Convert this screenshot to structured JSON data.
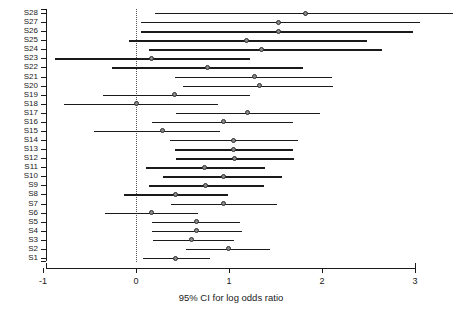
{
  "chart_data": {
    "type": "errorbar",
    "title": "",
    "xlabel": "95% CI for log odds ratio",
    "ylabel": "",
    "xlim": [
      -1,
      3
    ],
    "xticks": [
      -1,
      0,
      1,
      2,
      3
    ],
    "xticklabels": [
      "-1",
      "0",
      "1",
      "2",
      "3"
    ],
    "grid": false,
    "legend": null,
    "reference_line": {
      "x": 0,
      "style": "dotted"
    },
    "categories": [
      "S28",
      "S27",
      "S26",
      "S25",
      "S24",
      "S23",
      "S22",
      "S21",
      "S20",
      "S19",
      "S18",
      "S17",
      "S16",
      "S15",
      "S14",
      "S13",
      "S12",
      "S11",
      "S10",
      "S9",
      "S8",
      "S7",
      "S6",
      "S5",
      "S4",
      "S3",
      "S2",
      "S1"
    ],
    "points": [
      {
        "label": "S28",
        "estimate": 1.82,
        "lower": 0.2,
        "upper": 3.41
      },
      {
        "label": "S27",
        "estimate": 1.53,
        "lower": 0.05,
        "upper": 3.05
      },
      {
        "label": "S26",
        "estimate": 1.53,
        "lower": 0.05,
        "upper": 2.98
      },
      {
        "label": "S25",
        "estimate": 1.19,
        "lower": -0.08,
        "upper": 2.48
      },
      {
        "label": "S24",
        "estimate": 1.35,
        "lower": 0.14,
        "upper": 2.65
      },
      {
        "label": "S23",
        "estimate": 0.17,
        "lower": -0.87,
        "upper": 1.23
      },
      {
        "label": "S22",
        "estimate": 0.77,
        "lower": -0.26,
        "upper": 1.8
      },
      {
        "label": "S21",
        "estimate": 1.27,
        "lower": 0.42,
        "upper": 2.11
      },
      {
        "label": "S20",
        "estimate": 1.33,
        "lower": 0.51,
        "upper": 2.12
      },
      {
        "label": "S19",
        "estimate": 0.41,
        "lower": -0.35,
        "upper": 1.23
      },
      {
        "label": "S18",
        "estimate": 0.0,
        "lower": -0.77,
        "upper": 0.88
      },
      {
        "label": "S17",
        "estimate": 1.2,
        "lower": 0.43,
        "upper": 1.98
      },
      {
        "label": "S16",
        "estimate": 0.94,
        "lower": 0.17,
        "upper": 1.69
      },
      {
        "label": "S15",
        "estimate": 0.28,
        "lower": -0.45,
        "upper": 0.9
      },
      {
        "label": "S14",
        "estimate": 1.05,
        "lower": 0.37,
        "upper": 1.74
      },
      {
        "label": "S13",
        "estimate": 1.05,
        "lower": 0.42,
        "upper": 1.69
      },
      {
        "label": "S12",
        "estimate": 1.06,
        "lower": 0.43,
        "upper": 1.7
      },
      {
        "label": "S11",
        "estimate": 0.74,
        "lower": 0.11,
        "upper": 1.39
      },
      {
        "label": "S10",
        "estimate": 0.94,
        "lower": 0.29,
        "upper": 1.57
      },
      {
        "label": "S9",
        "estimate": 0.75,
        "lower": 0.14,
        "upper": 1.38
      },
      {
        "label": "S8",
        "estimate": 0.43,
        "lower": -0.13,
        "upper": 0.99
      },
      {
        "label": "S7",
        "estimate": 0.94,
        "lower": 0.38,
        "upper": 1.52
      },
      {
        "label": "S6",
        "estimate": 0.17,
        "lower": -0.33,
        "upper": 0.67
      },
      {
        "label": "S5",
        "estimate": 0.65,
        "lower": 0.17,
        "upper": 1.12
      },
      {
        "label": "S4",
        "estimate": 0.65,
        "lower": 0.17,
        "upper": 1.14
      },
      {
        "label": "S3",
        "estimate": 0.6,
        "lower": 0.18,
        "upper": 1.05
      },
      {
        "label": "S2",
        "estimate": 0.99,
        "lower": 0.54,
        "upper": 1.44
      },
      {
        "label": "S1",
        "estimate": 0.43,
        "lower": 0.08,
        "upper": 0.8
      }
    ]
  },
  "colors": {
    "axis": "#1a1a1a",
    "line": "#1a1a1a",
    "point_fill": "#8a8a8a",
    "point_stroke": "#2b2b2b",
    "reference": "#555555",
    "background": "#ffffff"
  }
}
